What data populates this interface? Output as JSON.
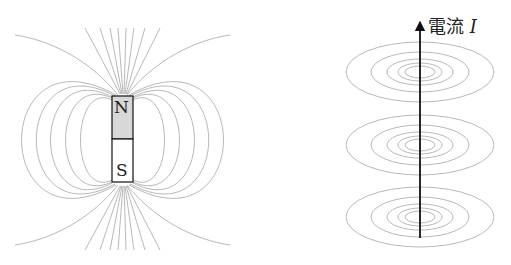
{
  "left_panel": {
    "title": "bar magnet field lines",
    "north_label": "N",
    "south_label": "S"
  },
  "right_panel": {
    "title": "magnetic field around straight current",
    "current_label": "電流",
    "current_symbol": "I",
    "loop_groups": 3
  },
  "colors": {
    "line": "#8a8a8a",
    "magnet_north": "#d8d8d8",
    "wire": "#111111"
  }
}
